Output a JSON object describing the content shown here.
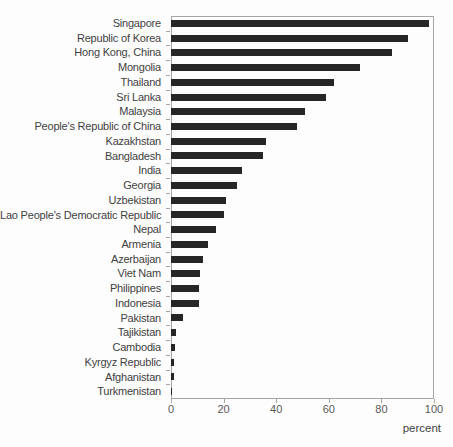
{
  "chart_data": {
    "type": "bar",
    "orientation": "horizontal",
    "xlabel": "percent",
    "xlim": [
      0,
      100
    ],
    "x_ticks": [
      0,
      20,
      40,
      60,
      80,
      100
    ],
    "grid": false,
    "legend": "none",
    "categories": [
      "Singapore",
      "Republic of Korea",
      "Hong Kong, China",
      "Mongolia",
      "Thailand",
      "Sri Lanka",
      "Malaysia",
      "People's Republic of China",
      "Kazakhstan",
      "Bangladesh",
      "India",
      "Georgia",
      "Uzbekistan",
      "Lao People's Democratic Republic",
      "Nepal",
      "Armenia",
      "Azerbaijan",
      "Viet Nam",
      "Philippines",
      "Indonesia",
      "Pakistan",
      "Tajikistan",
      "Cambodia",
      "Kyrgyz Republic",
      "Afghanistan",
      "Turkmenistan"
    ],
    "values": [
      98,
      90,
      84,
      72,
      62,
      59,
      51,
      48,
      36,
      35,
      27,
      25,
      21,
      20,
      17,
      14,
      12,
      11,
      10.7,
      10.6,
      4.5,
      2,
      1.7,
      1,
      1,
      0.2
    ],
    "colors": {
      "bar": "#262626",
      "axis": "#a6a6a6",
      "category_label": "#3f3f3f",
      "tick_label": "#595959",
      "background": "#fdfdfd"
    }
  }
}
